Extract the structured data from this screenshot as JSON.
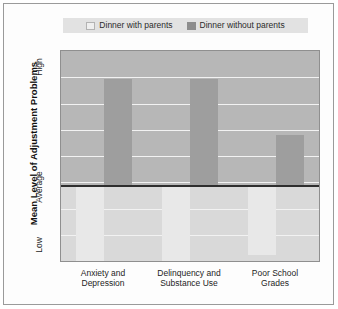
{
  "chart_data": {
    "type": "bar",
    "title": "",
    "subtitle": "",
    "xlabel": "",
    "ylabel": "Mean Level of Adjustment Problems",
    "categories": [
      "Anxiety and\nDepression",
      "Delinquency and\nSubstance Use",
      "Poor School\nGrades"
    ],
    "ytick_labels": [
      "High",
      "Average",
      "Low"
    ],
    "ylim": [
      -1.0,
      1.0
    ],
    "y_reference_line": 0,
    "grid": true,
    "gridline_count": 7,
    "legend_position": "top",
    "series": [
      {
        "name": "Dinner with parents",
        "color": "#e8e8e8",
        "values": [
          -1.0,
          -1.0,
          -0.92
        ]
      },
      {
        "name": "Dinner without parents",
        "color": "#9e9e9e",
        "values": [
          0.79,
          0.79,
          0.38
        ]
      }
    ]
  },
  "legend": {
    "entries": [
      {
        "label": "Dinner with parents",
        "swatch": "light-gray-swatch"
      },
      {
        "label": "Dinner without parents",
        "swatch": "dark-gray-swatch"
      }
    ]
  },
  "axes": {
    "y_title": "Mean Level of Adjustment Problems",
    "y_ticks": {
      "high": "High",
      "average": "Average",
      "low": "Low"
    },
    "x_ticks": [
      "Anxiety and\nDepression",
      "Delinquency and\nSubstance Use",
      "Poor School\nGrades"
    ]
  },
  "colors": {
    "plot_background_upper": "#b7b7b7",
    "plot_background_lower": "#d9d9d9",
    "bar_light": "#e8e8e8",
    "bar_dark": "#9e9e9e",
    "gridline": "#f2f2f2",
    "average_line": "#2e2e2e",
    "legend_background": "#e2e2e2",
    "frame": "#9a9a9a"
  }
}
